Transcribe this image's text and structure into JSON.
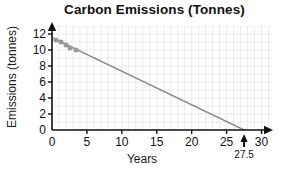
{
  "chart_data": {
    "type": "scatter",
    "title": "Carbon Emissions (Tonnes)",
    "xlabel": "Years",
    "ylabel": "Emissions (tonnes)",
    "xlim": [
      0,
      31.5
    ],
    "ylim": [
      0,
      13
    ],
    "xticks": [
      0,
      5,
      10,
      15,
      20,
      25,
      30
    ],
    "yticks": [
      0,
      2,
      4,
      6,
      8,
      10,
      12
    ],
    "grid": true,
    "legend": "none",
    "series": [
      {
        "name": "Observed emissions",
        "type": "scatter",
        "color": "#9a9a9a",
        "points": [
          {
            "x": 0.6,
            "y": 11.3
          },
          {
            "x": 1.3,
            "y": 11.0
          },
          {
            "x": 2.0,
            "y": 10.6
          },
          {
            "x": 2.6,
            "y": 10.3
          },
          {
            "x": 3.4,
            "y": 10.0
          }
        ]
      },
      {
        "name": "Trend line",
        "type": "line",
        "color": "#8a8a8a",
        "x": [
          0,
          27.5
        ],
        "y": [
          11.55,
          0
        ]
      }
    ],
    "annotations": [
      {
        "name": "x-intercept-arrow",
        "x": 27.5,
        "y": 0,
        "label": "27.5",
        "marker": "up-arrow"
      }
    ]
  },
  "ticklabels": {
    "x": [
      "0",
      "5",
      "10",
      "15",
      "20",
      "25",
      "30"
    ],
    "y": [
      "0",
      "2",
      "4",
      "6",
      "8",
      "10",
      "12"
    ]
  }
}
